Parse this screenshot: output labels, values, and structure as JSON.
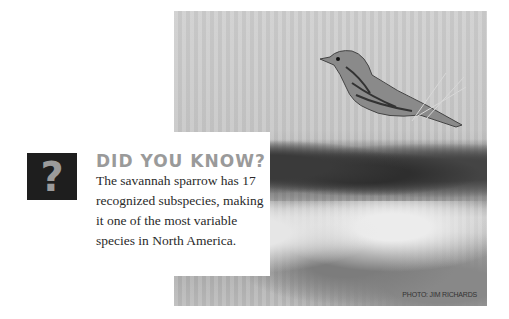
{
  "photo": {
    "subject": "savannah sparrow perched on grassy tundra",
    "credit": "PHOTO: JIM RICHARDS"
  },
  "callout": {
    "icon": "question-mark-icon",
    "icon_glyph": "?",
    "heading": "DID YOU KNOW?",
    "body": "The savannah sparrow has 17 recognized subspecies, making it one of  the most variable species in North America."
  },
  "colors": {
    "icon_bg": "#1e1e1e",
    "icon_glyph": "#9b9b9b",
    "heading": "#9a9a9a",
    "body_text": "#2a2a2a"
  }
}
